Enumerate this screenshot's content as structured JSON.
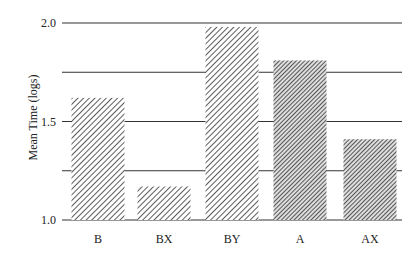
{
  "chart_data": {
    "type": "bar",
    "title": "",
    "xlabel": "",
    "ylabel": "Mean Time (logs)",
    "categories": [
      "B",
      "BX",
      "BY",
      "A",
      "AX"
    ],
    "values": [
      1.62,
      1.17,
      1.98,
      1.81,
      1.41
    ],
    "ylim": [
      1.0,
      2.0
    ],
    "yticks": [
      "1.0",
      "1.5",
      "2.0"
    ],
    "gridlines": [
      1.0,
      1.25,
      1.5,
      1.75,
      2.0
    ],
    "grid": true,
    "legend": null,
    "hatch": [
      "sparse",
      "sparse",
      "sparse",
      "dense",
      "dense"
    ]
  }
}
